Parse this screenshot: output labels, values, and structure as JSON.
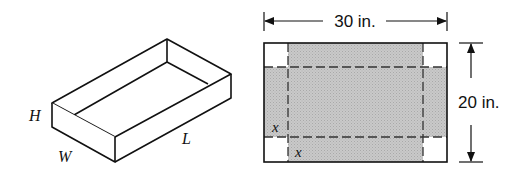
{
  "box_figure": {
    "labels": {
      "height": "H",
      "width": "W",
      "length": "L"
    }
  },
  "sheet_figure": {
    "width_label": "30 in.",
    "height_label": "20 in.",
    "cut_label_vertical": "x",
    "cut_label_horizontal": "x",
    "fill_color": "#c4c4c4",
    "corner_color": "#ffffff",
    "line_color": "#222222"
  }
}
